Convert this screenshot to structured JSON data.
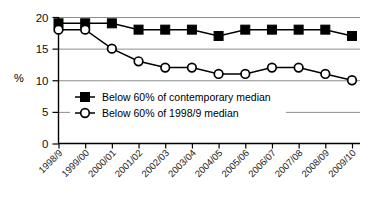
{
  "chart_data": {
    "type": "line",
    "title": "",
    "xlabel": "",
    "ylabel": "%",
    "ylim": [
      0,
      20
    ],
    "yticks": [
      0,
      5,
      10,
      15,
      20
    ],
    "ytick_labels": [
      "0",
      "5",
      "10",
      "15",
      "20"
    ],
    "grid": true,
    "grid_axis": "y",
    "legend_position": "inside-lower-left",
    "categories": [
      "1998/9",
      "1999/00",
      "2000/01",
      "2001/02",
      "2002/03",
      "2003/04",
      "2004/05",
      "2005/06",
      "2006/07",
      "2007/08",
      "2008/09",
      "2009/10"
    ],
    "series": [
      {
        "name": "Below 60% of contemporary median",
        "marker": "filled-square",
        "values": [
          19,
          19,
          19,
          18,
          18,
          18,
          17,
          18,
          18,
          18,
          18,
          17
        ]
      },
      {
        "name": "Below 60% of 1998/9 median",
        "marker": "open-circle",
        "values": [
          18,
          18,
          15,
          13,
          12,
          12,
          11,
          11,
          12,
          12,
          11,
          10
        ]
      }
    ]
  },
  "axis": {
    "y_label": "%"
  },
  "legend": {
    "entries": [
      {
        "label": "Below 60% of contemporary median",
        "marker": "filled-square"
      },
      {
        "label": "Below 60% of 1998/9 median",
        "marker": "open-circle"
      }
    ]
  },
  "colors": {
    "line": "#000000",
    "grid": "#8c8c8c",
    "background": "#ffffff",
    "text": "#000000"
  }
}
